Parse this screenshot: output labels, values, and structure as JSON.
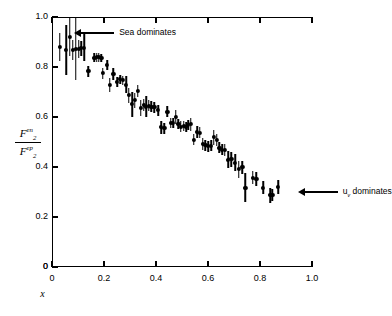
{
  "figure": {
    "background_color": "#ffffff",
    "ink_color": "#000000"
  },
  "axes": {
    "x": {
      "label": "x",
      "ticks": [
        "0",
        "0.2",
        "0.4",
        "0.6",
        "0.8",
        "1.0"
      ],
      "tick_values": [
        0,
        0.2,
        0.4,
        0.6,
        0.8,
        1.0
      ],
      "min": 0,
      "max": 1.0
    },
    "y": {
      "label_numerator_base": "F",
      "label_numerator_sub": "2",
      "label_numerator_sup": "en",
      "label_denominator_base": "F",
      "label_denominator_sub": "2",
      "label_denominator_sup": "ep",
      "ticks": [
        "0",
        "0.2",
        "0.4",
        "0.6",
        "0.8",
        "1.0"
      ],
      "tick_values": [
        0,
        0.2,
        0.4,
        0.6,
        0.8,
        1.0
      ],
      "min": 0,
      "max": 1.0
    }
  },
  "annotations": [
    {
      "id": "sea-dominates",
      "text": "Sea dominates",
      "x": 0.07,
      "y": 0.935,
      "direction": "left"
    },
    {
      "id": "uv-dominates",
      "text_base": "u",
      "text_sub": "v",
      "text_rest": " dominates",
      "text": "u_v dominates",
      "x": 0.93,
      "y": 0.3,
      "direction": "left"
    }
  ],
  "chart_data": {
    "type": "scatter",
    "title": "",
    "subtitle": "",
    "xlabel": "x",
    "ylabel": "F_2^en / F_2^ep",
    "xlim": [
      0,
      1.0
    ],
    "ylim": [
      0,
      1.0
    ],
    "grid": false,
    "legend": null,
    "marker": "filled-circle",
    "errorbars": "vertical",
    "series": [
      {
        "name": "F2en/F2ep ratio",
        "points": [
          {
            "x": 0.03,
            "y": 0.88,
            "yerr": 0.055
          },
          {
            "x": 0.055,
            "y": 0.868,
            "yerr": 0.1
          },
          {
            "x": 0.068,
            "y": 0.92,
            "yerr": 0.075
          },
          {
            "x": 0.08,
            "y": 0.87,
            "yerr": 0.04
          },
          {
            "x": 0.092,
            "y": 0.872,
            "yerr": 0.125
          },
          {
            "x": 0.102,
            "y": 0.872,
            "yerr": 0.035
          },
          {
            "x": 0.112,
            "y": 0.875,
            "yerr": 0.03
          },
          {
            "x": 0.124,
            "y": 0.878,
            "yerr": 0.055
          },
          {
            "x": 0.14,
            "y": 0.783,
            "yerr": 0.022
          },
          {
            "x": 0.163,
            "y": 0.838,
            "yerr": 0.018
          },
          {
            "x": 0.172,
            "y": 0.84,
            "yerr": 0.018
          },
          {
            "x": 0.18,
            "y": 0.84,
            "yerr": 0.018
          },
          {
            "x": 0.19,
            "y": 0.838,
            "yerr": 0.016
          },
          {
            "x": 0.196,
            "y": 0.775,
            "yerr": 0.022
          },
          {
            "x": 0.212,
            "y": 0.81,
            "yerr": 0.02
          },
          {
            "x": 0.222,
            "y": 0.728,
            "yerr": 0.028
          },
          {
            "x": 0.236,
            "y": 0.772,
            "yerr": 0.024
          },
          {
            "x": 0.25,
            "y": 0.742,
            "yerr": 0.02
          },
          {
            "x": 0.262,
            "y": 0.752,
            "yerr": 0.018
          },
          {
            "x": 0.272,
            "y": 0.748,
            "yerr": 0.018
          },
          {
            "x": 0.285,
            "y": 0.73,
            "yerr": 0.035
          },
          {
            "x": 0.296,
            "y": 0.688,
            "yerr": 0.03
          },
          {
            "x": 0.308,
            "y": 0.652,
            "yerr": 0.05
          },
          {
            "x": 0.318,
            "y": 0.668,
            "yerr": 0.03
          },
          {
            "x": 0.33,
            "y": 0.705,
            "yerr": 0.024
          },
          {
            "x": 0.342,
            "y": 0.638,
            "yerr": 0.032
          },
          {
            "x": 0.352,
            "y": 0.648,
            "yerr": 0.024
          },
          {
            "x": 0.362,
            "y": 0.642,
            "yerr": 0.042
          },
          {
            "x": 0.372,
            "y": 0.645,
            "yerr": 0.022
          },
          {
            "x": 0.382,
            "y": 0.642,
            "yerr": 0.022
          },
          {
            "x": 0.394,
            "y": 0.64,
            "yerr": 0.022
          },
          {
            "x": 0.408,
            "y": 0.628,
            "yerr": 0.022
          },
          {
            "x": 0.42,
            "y": 0.56,
            "yerr": 0.026
          },
          {
            "x": 0.432,
            "y": 0.556,
            "yerr": 0.022
          },
          {
            "x": 0.444,
            "y": 0.622,
            "yerr": 0.022
          },
          {
            "x": 0.456,
            "y": 0.578,
            "yerr": 0.02
          },
          {
            "x": 0.466,
            "y": 0.575,
            "yerr": 0.02
          },
          {
            "x": 0.476,
            "y": 0.6,
            "yerr": 0.028
          },
          {
            "x": 0.486,
            "y": 0.572,
            "yerr": 0.02
          },
          {
            "x": 0.496,
            "y": 0.562,
            "yerr": 0.022
          },
          {
            "x": 0.506,
            "y": 0.566,
            "yerr": 0.02
          },
          {
            "x": 0.516,
            "y": 0.56,
            "yerr": 0.02
          },
          {
            "x": 0.524,
            "y": 0.568,
            "yerr": 0.02
          },
          {
            "x": 0.534,
            "y": 0.572,
            "yerr": 0.026
          },
          {
            "x": 0.546,
            "y": 0.51,
            "yerr": 0.022
          },
          {
            "x": 0.558,
            "y": 0.54,
            "yerr": 0.024
          },
          {
            "x": 0.568,
            "y": 0.538,
            "yerr": 0.022
          },
          {
            "x": 0.58,
            "y": 0.492,
            "yerr": 0.024
          },
          {
            "x": 0.59,
            "y": 0.488,
            "yerr": 0.022
          },
          {
            "x": 0.6,
            "y": 0.484,
            "yerr": 0.022
          },
          {
            "x": 0.612,
            "y": 0.486,
            "yerr": 0.022
          },
          {
            "x": 0.622,
            "y": 0.52,
            "yerr": 0.03
          },
          {
            "x": 0.634,
            "y": 0.508,
            "yerr": 0.024
          },
          {
            "x": 0.644,
            "y": 0.478,
            "yerr": 0.022
          },
          {
            "x": 0.654,
            "y": 0.47,
            "yerr": 0.022
          },
          {
            "x": 0.664,
            "y": 0.468,
            "yerr": 0.024
          },
          {
            "x": 0.678,
            "y": 0.43,
            "yerr": 0.035
          },
          {
            "x": 0.69,
            "y": 0.432,
            "yerr": 0.03
          },
          {
            "x": 0.704,
            "y": 0.418,
            "yerr": 0.034
          },
          {
            "x": 0.718,
            "y": 0.392,
            "yerr": 0.034
          },
          {
            "x": 0.732,
            "y": 0.4,
            "yerr": 0.026
          },
          {
            "x": 0.744,
            "y": 0.318,
            "yerr": 0.058
          },
          {
            "x": 0.772,
            "y": 0.358,
            "yerr": 0.026
          },
          {
            "x": 0.786,
            "y": 0.352,
            "yerr": 0.028
          },
          {
            "x": 0.812,
            "y": 0.318,
            "yerr": 0.026
          },
          {
            "x": 0.84,
            "y": 0.288,
            "yerr": 0.03
          },
          {
            "x": 0.848,
            "y": 0.29,
            "yerr": 0.024
          },
          {
            "x": 0.87,
            "y": 0.322,
            "yerr": 0.028
          }
        ]
      }
    ]
  }
}
